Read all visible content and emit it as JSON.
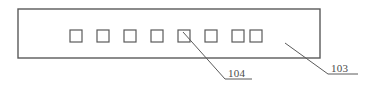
{
  "figure": {
    "type": "patent-line-drawing",
    "background_color": "#ffffff",
    "line_color": "#5a5a5a",
    "text_color": "#4a4a4a",
    "outer_body": {
      "name": "substrate-outline",
      "x": 18,
      "y": 9,
      "width": 302,
      "height": 49
    },
    "squares": {
      "count": 8,
      "size": 12,
      "y": 30,
      "x_positions": [
        70,
        97,
        124,
        151,
        178,
        205,
        232,
        250
      ],
      "highlighted_index": 4
    },
    "callouts": [
      {
        "id": "callout-104",
        "label": "104",
        "text_x": 228,
        "text_y": 77,
        "underline": {
          "x1": 225,
          "y1": 79,
          "x2": 252,
          "y2": 79
        },
        "leader": {
          "x1": 183,
          "y1": 32,
          "x2": 225,
          "y2": 79
        }
      },
      {
        "id": "callout-103",
        "label": "103",
        "text_x": 331,
        "text_y": 72,
        "underline": {
          "x1": 328,
          "y1": 74,
          "x2": 358,
          "y2": 74
        },
        "leader": {
          "x1": 285,
          "y1": 43,
          "x2": 328,
          "y2": 74
        }
      }
    ]
  }
}
